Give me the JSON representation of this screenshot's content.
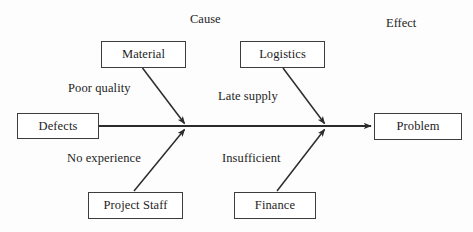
{
  "diagram": {
    "type": "fishbone-ishikawa",
    "background_color": "#fdfdfd",
    "line_color": "#2b2b2b",
    "box_border_color": "#3d3d3d",
    "text_color": "#1d1d1d",
    "headers": {
      "cause": "Cause",
      "effect": "Effect"
    },
    "effect_node": {
      "label": "Problem"
    },
    "spine_start_node": {
      "label": "Defects"
    },
    "cause_nodes": [
      {
        "label": "Material"
      },
      {
        "label": "Logistics"
      },
      {
        "label": "Project Staff"
      },
      {
        "label": "Finance"
      }
    ],
    "branch_labels": [
      {
        "label": "Poor quality"
      },
      {
        "label": "Late supply"
      },
      {
        "label": "No experience"
      },
      {
        "label": "Insufficient"
      }
    ]
  }
}
